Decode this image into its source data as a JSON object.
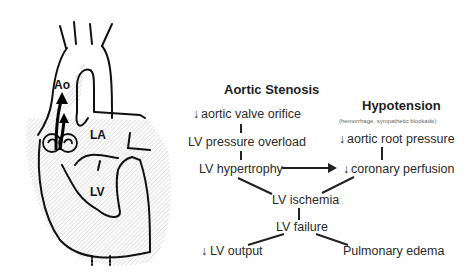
{
  "heart_illustration": {
    "labels": {
      "aorta": "Ao",
      "left_atrium": "LA",
      "left_ventricle": "LV"
    }
  },
  "flowchart": {
    "aortic_stenosis": {
      "heading": "Aortic Stenosis",
      "steps": [
        "aortic valve orifice",
        "LV pressure overload",
        "LV hypertrophy"
      ],
      "first_step_prefix": "↓"
    },
    "hypotension": {
      "heading": "Hypotension",
      "subheading": "(hemorrhage, sympathetic blockade)",
      "steps": [
        "aortic root pressure",
        "coronary perfusion"
      ],
      "step_prefix": "↓"
    },
    "common": {
      "ischemia": "LV ischemia",
      "failure": "LV failure",
      "output": "LV output",
      "output_prefix": "↓",
      "edema": "Pulmonary edema"
    }
  }
}
